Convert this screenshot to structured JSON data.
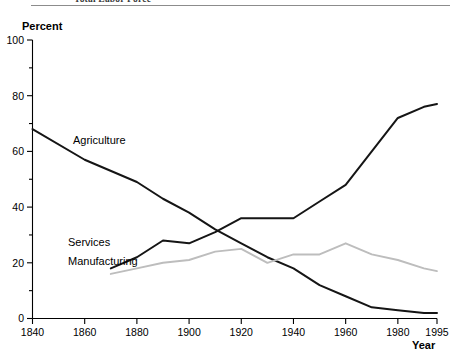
{
  "figure": {
    "title": "Total Labor Force",
    "title_truncated": true
  },
  "axes": {
    "ylabel": "Percent",
    "xlabel": "Year"
  },
  "labels": {
    "agriculture": "Agriculture",
    "services": "Services",
    "manufacturing": "Manufacturing"
  },
  "ticks": {
    "y_major": [
      "0",
      "20",
      "40",
      "60",
      "80",
      "100"
    ],
    "x": [
      "1840",
      "1860",
      "1880",
      "1900",
      "1920",
      "1940",
      "1960",
      "1980",
      "1995"
    ]
  },
  "colors": {
    "agriculture": "#151515",
    "services": "#151515",
    "manufacturing": "#bdbdbd",
    "axis": "#000000",
    "rule": "#8c8c8c"
  },
  "chart_data": {
    "type": "line",
    "title": "Total Labor Force",
    "xlabel": "Year",
    "ylabel": "Percent",
    "xlim": [
      1840,
      1995
    ],
    "ylim": [
      0,
      100
    ],
    "ytick_major": [
      0,
      20,
      40,
      60,
      80,
      100
    ],
    "ytick_minor": [
      10,
      30,
      50,
      70,
      90
    ],
    "xticks": [
      1840,
      1860,
      1880,
      1900,
      1920,
      1940,
      1960,
      1980,
      1995
    ],
    "grid": false,
    "legend": "inline-labels",
    "series": [
      {
        "name": "Agriculture",
        "color": "#151515",
        "x": [
          1840,
          1860,
          1880,
          1890,
          1900,
          1910,
          1920,
          1930,
          1940,
          1950,
          1960,
          1970,
          1980,
          1990,
          1995
        ],
        "y": [
          68,
          57,
          49,
          43,
          38,
          32,
          27,
          22,
          18,
          12,
          8,
          4,
          3,
          2,
          2
        ]
      },
      {
        "name": "Services",
        "color": "#151515",
        "x": [
          1870,
          1880,
          1890,
          1900,
          1910,
          1920,
          1930,
          1940,
          1950,
          1960,
          1970,
          1980,
          1990,
          1995
        ],
        "y": [
          18,
          22,
          28,
          27,
          31,
          36,
          36,
          36,
          42,
          48,
          60,
          72,
          76,
          77
        ]
      },
      {
        "name": "Manufacturing",
        "color": "#bdbdbd",
        "x": [
          1870,
          1880,
          1890,
          1900,
          1910,
          1920,
          1930,
          1940,
          1950,
          1960,
          1970,
          1980,
          1990,
          1995
        ],
        "y": [
          16,
          18,
          20,
          21,
          24,
          25,
          20,
          23,
          23,
          27,
          23,
          21,
          18,
          17
        ]
      }
    ]
  }
}
